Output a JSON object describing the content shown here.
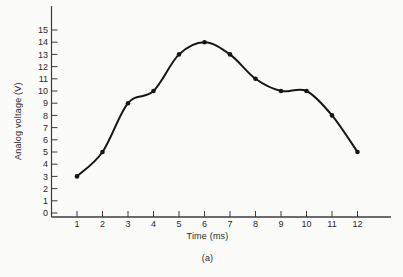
{
  "chart_data": {
    "type": "line",
    "title": "",
    "xlabel": "Time (ms)",
    "ylabel": "Analog voltage (V)",
    "caption": "(a)",
    "x": [
      1,
      2,
      3,
      4,
      5,
      6,
      7,
      8,
      9,
      10,
      11,
      12
    ],
    "values": [
      3,
      5,
      9,
      10,
      13,
      14,
      13,
      11,
      10,
      10,
      8,
      5
    ],
    "series_name": "analog-voltage-waveform",
    "x_ticks": [
      1,
      2,
      3,
      4,
      5,
      6,
      7,
      8,
      9,
      10,
      11,
      12
    ],
    "y_ticks": [
      0,
      1,
      2,
      3,
      4,
      5,
      6,
      7,
      8,
      9,
      10,
      11,
      12,
      13,
      14,
      15
    ],
    "xlim": [
      0,
      13.3
    ],
    "ylim": [
      0,
      15
    ],
    "grid": false,
    "legend": "none",
    "line_color": "#161616",
    "axis_color": "#3c3c3c",
    "marker": "dot",
    "background_color": "#fbfbf9"
  }
}
